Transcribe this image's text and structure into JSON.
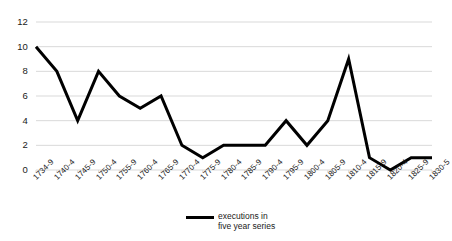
{
  "chart_data": {
    "type": "line",
    "title": "",
    "subtitle": "",
    "xlabel": "",
    "ylabel": "",
    "categories": [
      "1734-9",
      "1740-4",
      "1745-9",
      "1750-4",
      "1755-9",
      "1760-4",
      "1765-9",
      "1770-4",
      "1775-9",
      "1780-4",
      "1785-9",
      "1790-4",
      "1795-9",
      "1800-4",
      "1805-9",
      "1810-4",
      "1815-9",
      "1820-4",
      "1825-9",
      "1830-5"
    ],
    "values": [
      10,
      8,
      4,
      8,
      6,
      5,
      6,
      2,
      1,
      2,
      2,
      2,
      4,
      2,
      4,
      9,
      1,
      0,
      1,
      1
    ],
    "series": [
      {
        "name": "executions in five year series",
        "color": "#000000",
        "values": [
          10,
          8,
          4,
          8,
          6,
          5,
          6,
          2,
          1,
          2,
          2,
          2,
          4,
          2,
          4,
          9,
          1,
          0,
          1,
          1
        ]
      }
    ],
    "ylim": [
      0,
      12
    ],
    "xlim_categories": 20,
    "y_ticks": [
      0,
      2,
      4,
      6,
      8,
      10,
      12
    ],
    "grid": true,
    "grid_axis": "y",
    "grid_color": "#d9d9d9",
    "legend_position": "bottom-center",
    "legend_entries": [
      "executions in five year series"
    ]
  },
  "legend": {
    "line1": "executions in",
    "line2": "five year series",
    "swatch_name": "series-line-swatch"
  },
  "colors": {
    "line": "#000000",
    "grid": "#d9d9d9",
    "background": "#ffffff",
    "text": "#1a1a1a"
  }
}
